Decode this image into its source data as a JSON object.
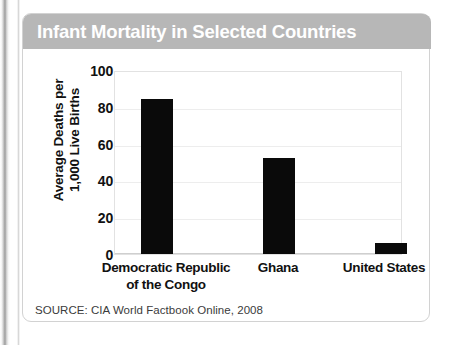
{
  "card": {
    "title": "Infant Mortality in Selected Countries",
    "source": "SOURCE: CIA World Factbook Online, 2008",
    "title_band_color": "#b7b7b7",
    "title_text_color": "#ffffff",
    "border_color": "#d2d2d2",
    "bar_color": "#0a0a0a"
  },
  "chart_data": {
    "type": "bar",
    "title": "Infant Mortality in Selected Countries",
    "categories": [
      "Democratic Republic\nof the Congo",
      "Ghana",
      "United States"
    ],
    "category_lines": [
      [
        "Democratic Republic",
        "of the Congo"
      ],
      [
        "Ghana"
      ],
      [
        "United States"
      ]
    ],
    "values": [
      84,
      52,
      6
    ],
    "xlabel": "",
    "ylabel": "Average Deaths per 1,000 Live Births",
    "ylabel_lines": [
      "Average Deaths per",
      "1,000 Live Births"
    ],
    "ylim": [
      0,
      100
    ],
    "yticks": [
      100,
      80,
      60,
      40,
      20,
      0
    ],
    "grid": true,
    "legend": "none",
    "source": "SOURCE: CIA World Factbook Online, 2008"
  }
}
